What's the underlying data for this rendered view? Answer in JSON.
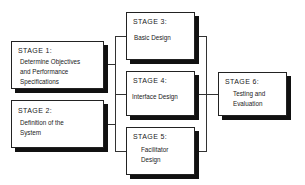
{
  "diagram": {
    "stages": [
      {
        "id": "stage1",
        "title": "STAGE 1:",
        "description": "Determine Objectives\nand Performance\nSpecifications"
      },
      {
        "id": "stage2",
        "title": "STAGE 2:",
        "description": "Definition of the\nSystem"
      },
      {
        "id": "stage3",
        "title": "STAGE 3:",
        "description": "Basic Design"
      },
      {
        "id": "stage4",
        "title": "STAGE 4:",
        "description": "Interface Design"
      },
      {
        "id": "stage5",
        "title": "STAGE 5:",
        "description": "Facilitator\nDesign"
      },
      {
        "id": "stage6",
        "title": "STAGE 6:",
        "description": "Testing and\nEvaluation"
      }
    ],
    "connections": [
      {
        "from": [
          "stage1",
          "stage2"
        ],
        "to": [
          "stage3",
          "stage4",
          "stage5"
        ]
      },
      {
        "from": [
          "stage3",
          "stage4",
          "stage5"
        ],
        "to": [
          "stage6"
        ]
      }
    ],
    "colors": {
      "border": "#222222",
      "shadow": "#111111",
      "line": "#333333",
      "background": "#ffffff"
    }
  }
}
